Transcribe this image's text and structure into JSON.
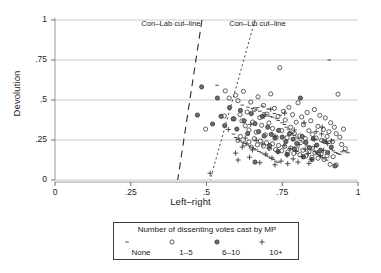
{
  "chart_data": {
    "type": "scatter",
    "title": "",
    "xlabel": "Left–right",
    "ylabel": "Devolution",
    "xlim": [
      0,
      1
    ],
    "ylim": [
      0,
      1
    ],
    "grid": "horizontal",
    "xticks": [
      "0",
      ".25",
      ".5",
      ".75",
      "1"
    ],
    "xtick_values": [
      0,
      0.25,
      0.5,
      0.75,
      1
    ],
    "yticks": [
      "0",
      ".25",
      ".5",
      ".75",
      "1"
    ],
    "ytick_values": [
      0,
      0.25,
      0.5,
      0.75,
      1
    ],
    "annotations": [
      {
        "text": "Con–Lab cut–line",
        "x": 0.43,
        "y": 0.98
      },
      {
        "text": "Con–Lib cut–line",
        "x": 0.72,
        "y": 0.98
      }
    ],
    "reference_lines": [
      {
        "name": "Con-Lab cut-line",
        "style": "dashed",
        "x_at_y1": 0.485,
        "x_at_y0": 0.405
      },
      {
        "name": "Con-Lib cut-line",
        "style": "dotted",
        "x_at_y1": 0.66,
        "x_at_y0": 0.512
      }
    ],
    "legend": {
      "position": "below",
      "title": "Number of dissenting votes cast by MP",
      "entries": [
        {
          "symbol": "dash",
          "label": "None"
        },
        {
          "symbol": "open-circle",
          "label": "1–5"
        },
        {
          "symbol": "filled-circle",
          "label": "6–10"
        },
        {
          "symbol": "plus",
          "label": "10+"
        }
      ]
    },
    "series": [
      {
        "name": "None",
        "marker": "dash",
        "points": [
          [
            0.535,
            0.592
          ],
          [
            0.618,
            0.468
          ],
          [
            0.637,
            0.455
          ],
          [
            0.652,
            0.447
          ],
          [
            0.663,
            0.438
          ],
          [
            0.669,
            0.452
          ],
          [
            0.676,
            0.43
          ],
          [
            0.684,
            0.462
          ],
          [
            0.69,
            0.42
          ],
          [
            0.697,
            0.41
          ],
          [
            0.703,
            0.444
          ],
          [
            0.711,
            0.398
          ],
          [
            0.718,
            0.392
          ],
          [
            0.724,
            0.415
          ],
          [
            0.731,
            0.383
          ],
          [
            0.737,
            0.372
          ],
          [
            0.743,
            0.405
          ],
          [
            0.75,
            0.358
          ],
          [
            0.757,
            0.347
          ],
          [
            0.763,
            0.33
          ],
          [
            0.77,
            0.318
          ],
          [
            0.776,
            0.305
          ],
          [
            0.783,
            0.292
          ],
          [
            0.79,
            0.28
          ],
          [
            0.797,
            0.268
          ],
          [
            0.803,
            0.258
          ],
          [
            0.81,
            0.248
          ],
          [
            0.816,
            0.238
          ],
          [
            0.823,
            0.228
          ],
          [
            0.83,
            0.218
          ],
          [
            0.836,
            0.208
          ],
          [
            0.843,
            0.198
          ],
          [
            0.85,
            0.188
          ],
          [
            0.857,
            0.178
          ],
          [
            0.863,
            0.168
          ],
          [
            0.87,
            0.158
          ],
          [
            0.877,
            0.15
          ],
          [
            0.884,
            0.14
          ],
          [
            0.89,
            0.132
          ],
          [
            0.897,
            0.124
          ],
          [
            0.905,
            0.75
          ],
          [
            0.912,
            0.192
          ],
          [
            0.919,
            0.182
          ],
          [
            0.926,
            0.172
          ],
          [
            0.933,
            0.166
          ],
          [
            0.94,
            0.16
          ],
          [
            0.947,
            0.176
          ],
          [
            0.953,
            0.184
          ],
          [
            0.96,
            0.176
          ],
          [
            0.967,
            0.17
          ],
          [
            0.589,
            0.287
          ],
          [
            0.596,
            0.265
          ],
          [
            0.604,
            0.254
          ],
          [
            0.611,
            0.245
          ],
          [
            0.619,
            0.236
          ],
          [
            0.627,
            0.228
          ],
          [
            0.634,
            0.22
          ],
          [
            0.642,
            0.212
          ],
          [
            0.65,
            0.204
          ],
          [
            0.658,
            0.196
          ],
          [
            0.665,
            0.188
          ],
          [
            0.673,
            0.178
          ],
          [
            0.681,
            0.17
          ],
          [
            0.689,
            0.162
          ],
          [
            0.697,
            0.152
          ],
          [
            0.705,
            0.145
          ],
          [
            0.712,
            0.136
          ],
          [
            0.72,
            0.128
          ],
          [
            0.728,
            0.118
          ],
          [
            0.736,
            0.11
          ]
        ]
      },
      {
        "name": "1-5",
        "marker": "open-circle",
        "points": [
          [
            0.497,
            0.318
          ],
          [
            0.559,
            0.4
          ],
          [
            0.562,
            0.557
          ],
          [
            0.575,
            0.512
          ],
          [
            0.591,
            0.382
          ],
          [
            0.596,
            0.529
          ],
          [
            0.604,
            0.496
          ],
          [
            0.611,
            0.409
          ],
          [
            0.617,
            0.37
          ],
          [
            0.622,
            0.554
          ],
          [
            0.628,
            0.339
          ],
          [
            0.634,
            0.425
          ],
          [
            0.64,
            0.313
          ],
          [
            0.646,
            0.487
          ],
          [
            0.652,
            0.362
          ],
          [
            0.658,
            0.441
          ],
          [
            0.664,
            0.299
          ],
          [
            0.67,
            0.52
          ],
          [
            0.676,
            0.39
          ],
          [
            0.682,
            0.342
          ],
          [
            0.688,
            0.466
          ],
          [
            0.694,
            0.282
          ],
          [
            0.7,
            0.412
          ],
          [
            0.706,
            0.356
          ],
          [
            0.712,
            0.538
          ],
          [
            0.718,
            0.322
          ],
          [
            0.724,
            0.448
          ],
          [
            0.73,
            0.268
          ],
          [
            0.736,
            0.398
          ],
          [
            0.742,
            0.702
          ],
          [
            0.748,
            0.309
          ],
          [
            0.754,
            0.429
          ],
          [
            0.76,
            0.375
          ],
          [
            0.766,
            0.264
          ],
          [
            0.772,
            0.454
          ],
          [
            0.778,
            0.33
          ],
          [
            0.784,
            0.408
          ],
          [
            0.79,
            0.29
          ],
          [
            0.796,
            0.361
          ],
          [
            0.802,
            0.482
          ],
          [
            0.808,
            0.276
          ],
          [
            0.814,
            0.394
          ],
          [
            0.82,
            0.345
          ],
          [
            0.826,
            0.259
          ],
          [
            0.832,
            0.422
          ],
          [
            0.838,
            0.308
          ],
          [
            0.844,
            0.37
          ],
          [
            0.85,
            0.285
          ],
          [
            0.856,
            0.44
          ],
          [
            0.862,
            0.262
          ],
          [
            0.868,
            0.335
          ],
          [
            0.874,
            0.404
          ],
          [
            0.88,
            0.248
          ],
          [
            0.886,
            0.316
          ],
          [
            0.892,
            0.388
          ],
          [
            0.898,
            0.272
          ],
          [
            0.904,
            0.302
          ],
          [
            0.91,
            0.358
          ],
          [
            0.916,
            0.24
          ],
          [
            0.922,
            0.33
          ],
          [
            0.928,
            0.29
          ],
          [
            0.934,
            0.536
          ],
          [
            0.94,
            0.268
          ],
          [
            0.946,
            0.222
          ],
          [
            0.952,
            0.318
          ],
          [
            0.958,
            0.196
          ],
          [
            0.604,
            0.248
          ],
          [
            0.612,
            0.272
          ],
          [
            0.626,
            0.226
          ],
          [
            0.64,
            0.238
          ],
          [
            0.648,
            0.205
          ],
          [
            0.658,
            0.258
          ],
          [
            0.668,
            0.22
          ],
          [
            0.678,
            0.244
          ],
          [
            0.688,
            0.212
          ],
          [
            0.698,
            0.232
          ],
          [
            0.708,
            0.198
          ],
          [
            0.718,
            0.226
          ],
          [
            0.728,
            0.19
          ],
          [
            0.738,
            0.216
          ],
          [
            0.748,
            0.182
          ],
          [
            0.758,
            0.21
          ],
          [
            0.768,
            0.174
          ],
          [
            0.778,
            0.2
          ],
          [
            0.788,
            0.166
          ],
          [
            0.798,
            0.194
          ],
          [
            0.808,
            0.158
          ],
          [
            0.818,
            0.186
          ],
          [
            0.828,
            0.15
          ],
          [
            0.838,
            0.178
          ],
          [
            0.848,
            0.142
          ],
          [
            0.858,
            0.17
          ],
          [
            0.868,
            0.136
          ],
          [
            0.878,
            0.162
          ],
          [
            0.888,
            0.128
          ],
          [
            0.898,
            0.152
          ],
          [
            0.908,
            0.098
          ],
          [
            0.918,
            0.146
          ],
          [
            0.928,
            0.094
          ]
        ]
      },
      {
        "name": "6-10",
        "marker": "filled-circle",
        "points": [
          [
            0.47,
            0.406
          ],
          [
            0.484,
            0.582
          ],
          [
            0.52,
            0.35
          ],
          [
            0.536,
            0.512
          ],
          [
            0.548,
            0.398
          ],
          [
            0.56,
            0.34
          ],
          [
            0.576,
            0.452
          ],
          [
            0.588,
            0.382
          ],
          [
            0.6,
            0.318
          ],
          [
            0.612,
            0.435
          ],
          [
            0.624,
            0.37
          ],
          [
            0.636,
            0.29
          ],
          [
            0.648,
            0.415
          ],
          [
            0.66,
            0.352
          ],
          [
            0.672,
            0.302
          ],
          [
            0.684,
            0.398
          ],
          [
            0.69,
            0.275
          ],
          [
            0.702,
            0.33
          ],
          [
            0.714,
            0.285
          ],
          [
            0.726,
            0.262
          ],
          [
            0.738,
            0.31
          ],
          [
            0.75,
            0.268
          ],
          [
            0.762,
            0.24
          ],
          [
            0.774,
            0.288
          ],
          [
            0.786,
            0.255
          ],
          [
            0.798,
            0.228
          ],
          [
            0.81,
            0.512
          ],
          [
            0.816,
            0.272
          ],
          [
            0.828,
            0.235
          ],
          [
            0.84,
            0.202
          ],
          [
            0.852,
            0.258
          ],
          [
            0.864,
            0.218
          ],
          [
            0.876,
            0.186
          ],
          [
            0.888,
            0.242
          ],
          [
            0.9,
            0.172
          ],
          [
            0.912,
            0.205
          ],
          [
            0.924,
            0.088
          ],
          [
            0.66,
            0.112
          ],
          [
            0.708,
            0.215
          ],
          [
            0.736,
            0.178
          ],
          [
            0.766,
            0.16
          ],
          [
            0.79,
            0.195
          ],
          [
            0.82,
            0.145
          ],
          [
            0.848,
            0.128
          ]
        ]
      },
      {
        "name": "10+",
        "marker": "plus",
        "points": [
          [
            0.512,
            0.042
          ],
          [
            0.572,
            0.316
          ],
          [
            0.596,
            0.168
          ],
          [
            0.604,
            0.125
          ],
          [
            0.618,
            0.206
          ],
          [
            0.628,
            0.262
          ],
          [
            0.642,
            0.142
          ],
          [
            0.652,
            0.188
          ],
          [
            0.664,
            0.248
          ],
          [
            0.676,
            0.108
          ],
          [
            0.686,
            0.225
          ],
          [
            0.696,
            0.162
          ],
          [
            0.706,
            0.198
          ],
          [
            0.716,
            0.138
          ],
          [
            0.726,
            0.272
          ],
          [
            0.736,
            0.175
          ],
          [
            0.746,
            0.118
          ],
          [
            0.756,
            0.215
          ],
          [
            0.766,
            0.155
          ],
          [
            0.776,
            0.196
          ],
          [
            0.786,
            0.132
          ],
          [
            0.796,
            0.178
          ],
          [
            0.806,
            0.222
          ],
          [
            0.816,
            0.146
          ],
          [
            0.826,
            0.192
          ],
          [
            0.836,
            0.165
          ],
          [
            0.846,
            0.128
          ],
          [
            0.856,
            0.208
          ],
          [
            0.866,
            0.172
          ],
          [
            0.876,
            0.152
          ],
          [
            0.886,
            0.186
          ],
          [
            0.896,
            0.238
          ],
          [
            0.726,
            0.095
          ],
          [
            0.768,
            0.102
          ],
          [
            0.802,
            0.112
          ],
          [
            0.838,
            0.104
          ],
          [
            0.856,
            0.255
          ],
          [
            0.88,
            0.288
          ],
          [
            0.9,
            0.228
          ],
          [
            0.912,
            0.245
          ],
          [
            0.646,
            0.348
          ],
          [
            0.69,
            0.398
          ],
          [
            0.712,
            0.442
          ],
          [
            0.758,
            0.418
          ],
          [
            0.79,
            0.312
          ],
          [
            0.822,
            0.358
          ],
          [
            0.862,
            0.302
          ],
          [
            0.882,
            0.33
          ]
        ]
      }
    ]
  }
}
